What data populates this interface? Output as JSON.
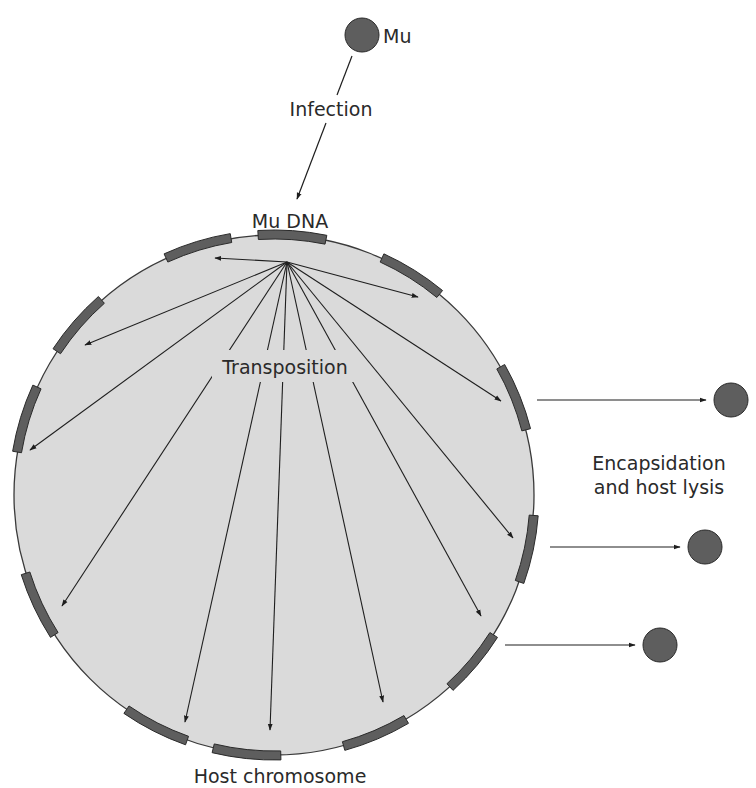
{
  "labels": {
    "phage": "Mu",
    "infection": "Infection",
    "mu_dna": "Mu DNA",
    "transposition": "Transposition",
    "encapsidation_line1": "Encapsidation",
    "encapsidation_line2": "and host lysis",
    "host_chromosome": "Host chromosome"
  },
  "colors": {
    "cell_fill": "#dadada",
    "cell_stroke": "#3a3a3a",
    "segment_fill": "#5e5e5e",
    "segment_stroke": "#2a2a2a",
    "phage_fill": "#5e5e5e",
    "line": "#1e1e1e",
    "text": "#2a2a2a"
  },
  "cell": {
    "cx": 274,
    "cy": 495,
    "r": 260
  },
  "fan_origin": {
    "x": 287,
    "y": 262
  },
  "segments_deg": [
    -86,
    -107,
    -139,
    -163,
    155,
    117,
    96,
    67,
    40,
    12,
    -22,
    -58
  ],
  "transposition_targets": [
    {
      "x": 215,
      "y": 258
    },
    {
      "x": 85,
      "y": 345
    },
    {
      "x": 30,
      "y": 450
    },
    {
      "x": 62,
      "y": 606
    },
    {
      "x": 185,
      "y": 722
    },
    {
      "x": 270,
      "y": 730
    },
    {
      "x": 383,
      "y": 702
    },
    {
      "x": 481,
      "y": 616
    },
    {
      "x": 513,
      "y": 538
    },
    {
      "x": 501,
      "y": 401
    },
    {
      "x": 418,
      "y": 297
    }
  ],
  "released_phages": [
    {
      "x1": 537,
      "x2": 706,
      "y": 400,
      "cx": 731
    },
    {
      "x1": 550,
      "x2": 680,
      "y": 547,
      "cx": 705
    },
    {
      "x1": 505,
      "x2": 635,
      "y": 645,
      "cx": 660
    }
  ]
}
